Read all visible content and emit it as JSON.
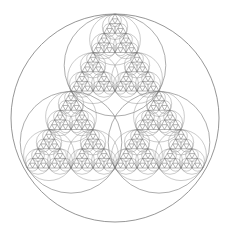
{
  "figure": {
    "title": "",
    "stroke_color": "#8a8a8a",
    "fill_color": "#6f6f6f",
    "background": "#ffffff",
    "outer_circle": {
      "cx": 115,
      "cy": 118,
      "r": 104
    },
    "triangle": {
      "apex": [
        115,
        14
      ],
      "bottom_left": [
        27,
        168
      ],
      "bottom_right": [
        203,
        168
      ]
    },
    "depth": 5
  }
}
